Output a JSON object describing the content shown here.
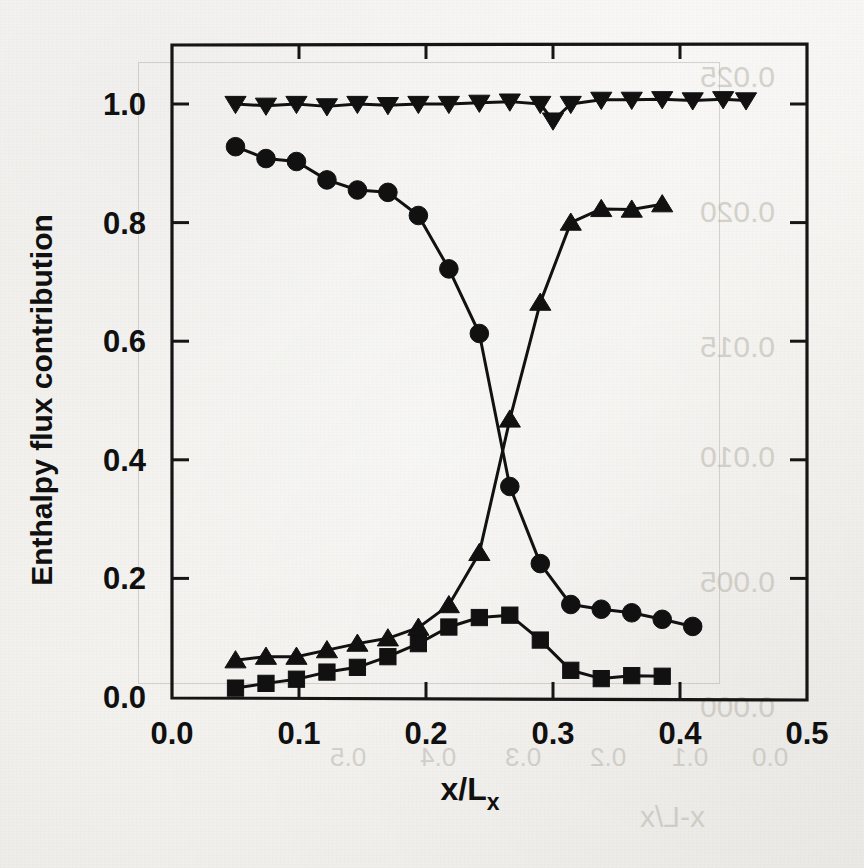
{
  "figure": {
    "axis_color": "#151515",
    "marker_color": "#111111",
    "line_color": "#111111",
    "background": "#f7f6f2"
  },
  "axes": {
    "y_title": "Enthalpy flux contribution",
    "x_title_main": "x/L",
    "x_title_sub": "x",
    "x_ticks": [
      "0.0",
      "0.1",
      "0.2",
      "0.3",
      "0.4",
      "0.5"
    ],
    "y_ticks": [
      "0.0",
      "0.2",
      "0.4",
      "0.6",
      "0.8",
      "1.0"
    ]
  },
  "ghost_text": {
    "note": "faint mirrored bleed-through from the reverse side of the scanned page",
    "items": [
      {
        "text": "0.025",
        "x": 700,
        "y": 60,
        "size": 30
      },
      {
        "text": "0.020",
        "x": 700,
        "y": 195,
        "size": 30
      },
      {
        "text": "0.015",
        "x": 700,
        "y": 330,
        "size": 30
      },
      {
        "text": "0.010",
        "x": 700,
        "y": 440,
        "size": 30
      },
      {
        "text": "0.005",
        "x": 700,
        "y": 565,
        "size": 30
      },
      {
        "text": "0.000",
        "x": 700,
        "y": 690,
        "size": 30
      },
      {
        "text": "0.5",
        "x": 330,
        "y": 742,
        "size": 26
      },
      {
        "text": "0.4",
        "x": 420,
        "y": 742,
        "size": 26
      },
      {
        "text": "0.3",
        "x": 505,
        "y": 742,
        "size": 26
      },
      {
        "text": "0.2",
        "x": 590,
        "y": 742,
        "size": 26
      },
      {
        "text": "0.1",
        "x": 672,
        "y": 742,
        "size": 26
      },
      {
        "text": "0.0",
        "x": 752,
        "y": 742,
        "size": 26
      },
      {
        "text": "x-L/x",
        "x": 640,
        "y": 800,
        "size": 30
      }
    ]
  },
  "chart_data": {
    "type": "line",
    "title": "",
    "xlabel": "x/Lx",
    "ylabel": "Enthalpy flux contribution",
    "xlim": [
      0.0,
      0.5
    ],
    "ylim": [
      0.0,
      1.05
    ],
    "xticks": [
      0.0,
      0.1,
      0.2,
      0.3,
      0.4,
      0.5
    ],
    "yticks": [
      0.0,
      0.2,
      0.4,
      0.6,
      0.8,
      1.0
    ],
    "grid": false,
    "legend": "none",
    "series": [
      {
        "name": "total enthalpy flux",
        "marker": "triangle-down",
        "points": [
          [
            0.05,
            1.0
          ],
          [
            0.074,
            0.997
          ],
          [
            0.098,
            1.0
          ],
          [
            0.122,
            0.996
          ],
          [
            0.146,
            1.0
          ],
          [
            0.17,
            0.998
          ],
          [
            0.194,
            1.0
          ],
          [
            0.218,
            1.0
          ],
          [
            0.242,
            1.002
          ],
          [
            0.266,
            1.004
          ],
          [
            0.29,
            1.0
          ],
          [
            0.3,
            0.972
          ],
          [
            0.314,
            1.0
          ],
          [
            0.338,
            1.007
          ],
          [
            0.362,
            1.007
          ],
          [
            0.386,
            1.008
          ],
          [
            0.41,
            1.006
          ],
          [
            0.434,
            1.008
          ],
          [
            0.452,
            1.006
          ]
        ]
      },
      {
        "name": "decreasing contribution",
        "marker": "circle",
        "points": [
          [
            0.05,
            0.928
          ],
          [
            0.074,
            0.908
          ],
          [
            0.098,
            0.903
          ],
          [
            0.122,
            0.872
          ],
          [
            0.146,
            0.855
          ],
          [
            0.17,
            0.851
          ],
          [
            0.194,
            0.812
          ],
          [
            0.218,
            0.722
          ],
          [
            0.242,
            0.613
          ],
          [
            0.266,
            0.355
          ],
          [
            0.29,
            0.225
          ],
          [
            0.314,
            0.156
          ],
          [
            0.338,
            0.148
          ],
          [
            0.362,
            0.142
          ],
          [
            0.386,
            0.131
          ],
          [
            0.41,
            0.119
          ]
        ]
      },
      {
        "name": "increasing contribution",
        "marker": "triangle-up",
        "points": [
          [
            0.05,
            0.062
          ],
          [
            0.074,
            0.068
          ],
          [
            0.098,
            0.068
          ],
          [
            0.122,
            0.079
          ],
          [
            0.146,
            0.09
          ],
          [
            0.17,
            0.099
          ],
          [
            0.194,
            0.117
          ],
          [
            0.218,
            0.155
          ],
          [
            0.242,
            0.243
          ],
          [
            0.266,
            0.468
          ],
          [
            0.29,
            0.665
          ],
          [
            0.314,
            0.8
          ],
          [
            0.338,
            0.823
          ],
          [
            0.362,
            0.822
          ],
          [
            0.386,
            0.831
          ]
        ]
      },
      {
        "name": "peaked contribution",
        "marker": "square",
        "points": [
          [
            0.05,
            0.015
          ],
          [
            0.074,
            0.023
          ],
          [
            0.098,
            0.03
          ],
          [
            0.122,
            0.042
          ],
          [
            0.146,
            0.05
          ],
          [
            0.17,
            0.068
          ],
          [
            0.194,
            0.09
          ],
          [
            0.218,
            0.118
          ],
          [
            0.242,
            0.134
          ],
          [
            0.266,
            0.138
          ],
          [
            0.29,
            0.096
          ],
          [
            0.314,
            0.045
          ],
          [
            0.338,
            0.031
          ],
          [
            0.362,
            0.036
          ],
          [
            0.386,
            0.035
          ]
        ]
      }
    ]
  }
}
